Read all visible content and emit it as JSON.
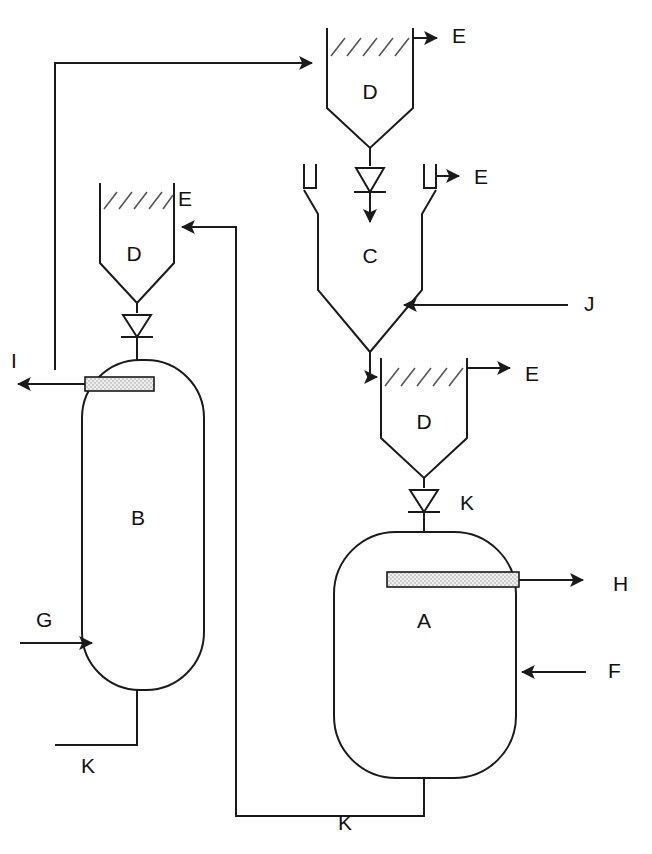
{
  "diagram": {
    "type": "process-flowsheet",
    "background_color": "#ffffff",
    "line_color": "#1a1a1a",
    "hatch_color": "#555555",
    "stipple_color": "#d8d8d8"
  },
  "units": [
    {
      "id": "A",
      "label": "A",
      "shape": "rounded-rectangle-vessel",
      "description": "Large lower-right vessel with internal stippled bar",
      "label_x": 424,
      "label_y": 622
    },
    {
      "id": "B",
      "label": "B",
      "shape": "tall-rounded-column",
      "description": "Tall left column with internal stippled bar",
      "label_x": 138,
      "label_y": 519
    },
    {
      "id": "C",
      "label": "C",
      "shape": "funnel-chamber",
      "description": "Middle funnel chamber with two hook vents",
      "label_x": 370,
      "label_y": 257
    },
    {
      "id": "D-top",
      "label": "D",
      "shape": "hopper-with-hatched-level",
      "description": "Top hopper feeding C",
      "label_x": 370,
      "label_y": 93
    },
    {
      "id": "D-left",
      "label": "D",
      "shape": "hopper-with-hatched-level",
      "description": "Middle-left hopper feeding B",
      "label_x": 134,
      "label_y": 255
    },
    {
      "id": "D-lower",
      "label": "D",
      "shape": "hopper-with-hatched-level",
      "description": "Lower hopper feeding A",
      "label_x": 424,
      "label_y": 423
    }
  ],
  "streams": [
    {
      "id": "E-top",
      "label": "E",
      "kind": "outlet",
      "label_x": 452,
      "label_y": 37
    },
    {
      "id": "E-left",
      "label": "E",
      "kind": "outlet",
      "label_x": 178,
      "label_y": 200
    },
    {
      "id": "E-mid",
      "label": "E",
      "kind": "outlet",
      "label_x": 474,
      "label_y": 178
    },
    {
      "id": "E-lower",
      "label": "E",
      "kind": "outlet",
      "label_x": 525,
      "label_y": 375
    },
    {
      "id": "F",
      "label": "F",
      "kind": "inlet",
      "label_x": 608,
      "label_y": 672
    },
    {
      "id": "G",
      "label": "G",
      "kind": "outlet",
      "label_x": 613,
      "label_y": 585
    },
    {
      "id": "H",
      "label": "H",
      "kind": "inlet",
      "label_x": 36,
      "label_y": 621
    },
    {
      "id": "I",
      "label": "I",
      "kind": "outlet",
      "label_x": 11,
      "label_y": 362
    },
    {
      "id": "J",
      "label": "J",
      "kind": "inlet",
      "label_x": 584,
      "label_y": 305
    },
    {
      "id": "K-valve-A",
      "label": "K",
      "kind": "valve",
      "label_x": 460,
      "label_y": 504
    },
    {
      "id": "K-recycle-B",
      "label": "K",
      "kind": "recycle",
      "label_x": 88,
      "label_y": 767
    },
    {
      "id": "K-recycle-A",
      "label": "K",
      "kind": "recycle",
      "label_x": 345,
      "label_y": 824
    }
  ],
  "legend_letters": [
    "A",
    "B",
    "C",
    "D",
    "E",
    "F",
    "G",
    "H",
    "I",
    "J",
    "K"
  ]
}
